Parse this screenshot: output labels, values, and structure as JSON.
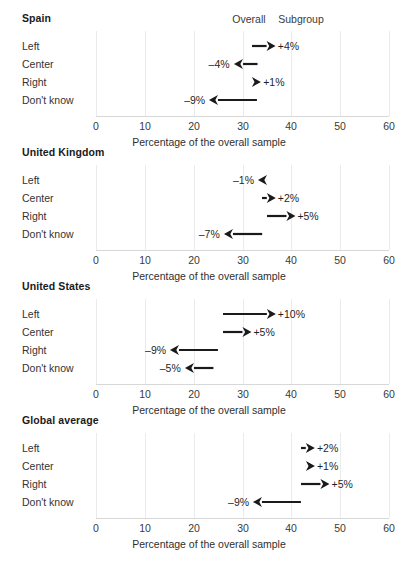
{
  "chart_data": {
    "type": "arrow_dot",
    "title": "",
    "xlabel": "Percentage of the overall sample",
    "ylabel": "",
    "xlim": [
      0,
      60
    ],
    "xticks": [
      0,
      10,
      20,
      30,
      40,
      50,
      60
    ],
    "xtick_labels": [
      "0",
      "10",
      "20",
      "30",
      "40",
      "50",
      "60"
    ],
    "grid": true,
    "legend_position": "top-right",
    "column_headers": [
      "Overall",
      "Subgroup"
    ],
    "categories": [
      "Left",
      "Center",
      "Right",
      "Don't know"
    ],
    "panels": [
      {
        "name": "Spain",
        "rows": [
          {
            "category": "Left",
            "overall": 32,
            "subgroup": 36,
            "delta": "+4%",
            "direction": "right"
          },
          {
            "category": "Center",
            "overall": 33,
            "subgroup": 29,
            "delta": "–4%",
            "direction": "left"
          },
          {
            "category": "Right",
            "overall": 32,
            "subgroup": 33,
            "delta": "+1%",
            "direction": "right"
          },
          {
            "category": "Don't know",
            "overall": 33,
            "subgroup": 24,
            "delta": "–9%",
            "direction": "left"
          }
        ]
      },
      {
        "name": "United Kingdom",
        "rows": [
          {
            "category": "Left",
            "overall": 35,
            "subgroup": 34,
            "delta": "–1%",
            "direction": "left"
          },
          {
            "category": "Center",
            "overall": 34,
            "subgroup": 36,
            "delta": "+2%",
            "direction": "right"
          },
          {
            "category": "Right",
            "overall": 35,
            "subgroup": 40,
            "delta": "+5%",
            "direction": "right"
          },
          {
            "category": "Don't know",
            "overall": 34,
            "subgroup": 27,
            "delta": "–7%",
            "direction": "left"
          }
        ]
      },
      {
        "name": "United States",
        "rows": [
          {
            "category": "Left",
            "overall": 26,
            "subgroup": 36,
            "delta": "+10%",
            "direction": "right"
          },
          {
            "category": "Center",
            "overall": 26,
            "subgroup": 31,
            "delta": "+5%",
            "direction": "right"
          },
          {
            "category": "Right",
            "overall": 25,
            "subgroup": 16,
            "delta": "–9%",
            "direction": "left"
          },
          {
            "category": "Don't know",
            "overall": 24,
            "subgroup": 19,
            "delta": "–5%",
            "direction": "left"
          }
        ]
      },
      {
        "name": "Global average",
        "rows": [
          {
            "category": "Left",
            "overall": 42,
            "subgroup": 44,
            "delta": "+2%",
            "direction": "right"
          },
          {
            "category": "Center",
            "overall": 43,
            "subgroup": 44,
            "delta": "+1%",
            "direction": "right"
          },
          {
            "category": "Right",
            "overall": 42,
            "subgroup": 47,
            "delta": "+5%",
            "direction": "right"
          },
          {
            "category": "Don't know",
            "overall": 42,
            "subgroup": 33,
            "delta": "–9%",
            "direction": "left"
          }
        ]
      }
    ]
  },
  "colors": {
    "arrow": "#1a1a1a",
    "grid": "#ebebeb",
    "text": "#2b2b2b",
    "background": "#ffffff"
  }
}
